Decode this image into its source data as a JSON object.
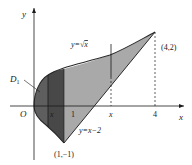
{
  "figure": {
    "axes": {
      "x_label": "x",
      "y_label": "y",
      "origin_label": "O"
    },
    "curves": {
      "upper": {
        "label": "y=√x",
        "label_prefix": "y=",
        "label_radicand": "x"
      },
      "lower": {
        "label": "y=x−2"
      }
    },
    "points": {
      "top_right": "(4,2)",
      "bottom": "(1,−1)"
    },
    "ticks": {
      "x1": "1",
      "x4": "4",
      "x_var_left": "x",
      "x_var_right": "x"
    },
    "regions": {
      "d1_label": "D",
      "d1_subscript": "1"
    },
    "colors": {
      "d1_fill": "#5e5e5e",
      "d1_strip_fill": "#484848",
      "d2_fill": "#a9a9a9",
      "stroke": "#2a2a2a",
      "background": "#ffffff"
    }
  }
}
